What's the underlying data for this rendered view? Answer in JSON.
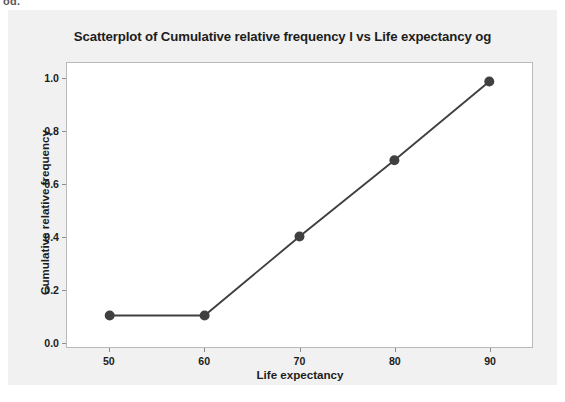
{
  "top_fragment": "og.",
  "card": {
    "background": "#f1f1f1"
  },
  "chart_data": {
    "type": "line",
    "title": "Scatterplot of Cumulative relative frequency l vs Life expectancy og",
    "xlabel": "Life expectancy",
    "ylabel": "Cumulative relative frequency",
    "x": [
      50,
      60,
      70,
      80,
      90
    ],
    "values": [
      0.1,
      0.1,
      0.4,
      0.69,
      0.99
    ],
    "xlim": [
      45.5,
      94.5
    ],
    "ylim": [
      -0.02,
      1.06
    ],
    "xticks": [
      50,
      60,
      70,
      80,
      90
    ],
    "xticklabels": [
      "50",
      "60",
      "70",
      "80",
      "90"
    ],
    "yticks": [
      0.0,
      0.2,
      0.4,
      0.6,
      0.8,
      1.0
    ],
    "yticklabels": [
      "0.0",
      "0.2",
      "0.4",
      "0.6",
      "0.8",
      "1.0"
    ],
    "grid": false,
    "legend": false,
    "marker": "circle",
    "marker_size": 5,
    "line_color": "#404040",
    "marker_color": "#404040",
    "plot_background": "#ffffff",
    "frame_color": "#b9b9b9"
  }
}
